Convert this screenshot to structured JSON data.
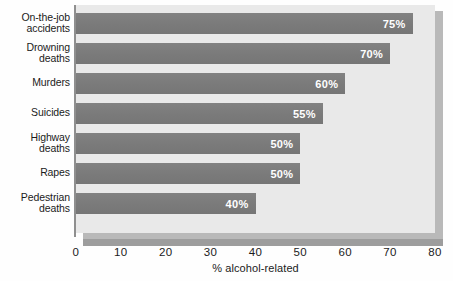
{
  "chart_data": {
    "type": "bar",
    "orientation": "horizontal",
    "title": "",
    "xlabel": "% alcohol-related",
    "ylabel": "",
    "xlim": [
      0,
      80
    ],
    "grid": false,
    "legend": null,
    "categories": [
      "On-the-job accidents",
      "Drowning deaths",
      "Murders",
      "Suicides",
      "Highway deaths",
      "Rapes",
      "Pedestrian deaths"
    ],
    "values": [
      75,
      70,
      60,
      55,
      50,
      50,
      40
    ],
    "value_labels": [
      "75%",
      "70%",
      "60%",
      "55%",
      "50%",
      "50%",
      "40%"
    ],
    "xticks": [
      0,
      10,
      20,
      30,
      40,
      50,
      60,
      70,
      80
    ],
    "xtick_labels": [
      "0",
      "10",
      "20",
      "30",
      "40",
      "50",
      "60",
      "70",
      "80"
    ],
    "colors": {
      "bar": "#7d7d7d",
      "plot_background": "#e9e9e9",
      "shadow": "#b9b9b9",
      "axis_line": "#8f8f8f",
      "value_label_text": "#ffffff",
      "category_label_text": "#1b1b1b",
      "tick_text": "#1b1b1b",
      "page_background": "#ffffff"
    }
  },
  "category_label_lines": [
    [
      "On-the-job",
      "accidents"
    ],
    [
      "Drowning",
      "deaths"
    ],
    [
      "Murders"
    ],
    [
      "Suicides"
    ],
    [
      "Highway",
      "deaths"
    ],
    [
      "Rapes"
    ],
    [
      "Pedestrian",
      "deaths"
    ]
  ]
}
